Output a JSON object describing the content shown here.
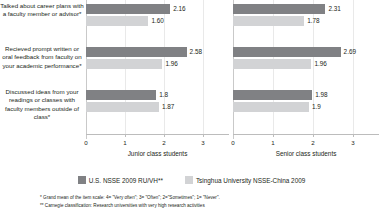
{
  "chart_data": {
    "type": "bar",
    "orientation": "horizontal",
    "title": "",
    "categories": [
      "Talked about career plans with a faculty member or advisor*",
      "Recieved prompt written or oral feedback from faculty on your academic performance*",
      "Discussed ideas from your readings or classes with faculty members outside of class*"
    ],
    "panels": [
      {
        "name": "junior",
        "xlabel": "Junior class students",
        "xlim": [
          0,
          3
        ],
        "xticks": [
          "0",
          "1",
          "2",
          "3"
        ],
        "series": [
          {
            "name": "U.S. NSSE 2009 RU/VH**",
            "values": [
              2.16,
              2.58,
              1.8
            ],
            "labels": [
              "2.16",
              "2.58",
              "1.8"
            ],
            "color": "#808184"
          },
          {
            "name": "Tsinghua University NSSE-China 2009",
            "values": [
              1.6,
              1.96,
              1.87
            ],
            "labels": [
              "1.60",
              "1.96",
              "1.87"
            ],
            "color": "#d2d3d5"
          }
        ]
      },
      {
        "name": "senior",
        "xlabel": "Senior class students",
        "xlim": [
          0,
          3
        ],
        "xticks": [
          "0",
          "1",
          "2",
          "3"
        ],
        "series": [
          {
            "name": "U.S. NSSE 2009 RU/VH**",
            "values": [
              2.31,
              2.69,
              1.98
            ],
            "labels": [
              "2.31",
              "2.69",
              "1.98"
            ],
            "color": "#808184"
          },
          {
            "name": "Tsinghua University NSSE-China 2009",
            "values": [
              1.78,
              1.96,
              1.9
            ],
            "labels": [
              "1.78",
              "1.96",
              "1.9"
            ],
            "color": "#d2d3d5"
          }
        ]
      }
    ],
    "legend": {
      "position": "bottom",
      "entries": [
        {
          "label": "U.S. NSSE 2009 RU/VH**",
          "color": "#808184"
        },
        {
          "label": "Tsinghua University NSSE-China 2009",
          "color": "#d2d3d5"
        }
      ]
    },
    "grid": true,
    "footnotes": [
      "* Grand mean of the item scale: 4= \"Very often\"; 3= \"Often\"; 2=\"Sometimes\"; 1= \"Never\".",
      "** Carnegie classification: Research universities with very high research activities"
    ]
  }
}
